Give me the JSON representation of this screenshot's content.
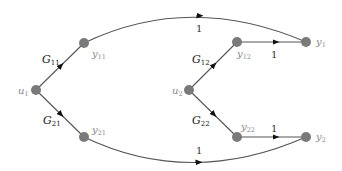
{
  "diagram": {
    "type": "signal-flow-graph",
    "nodes": [
      {
        "id": "u1",
        "label": "u",
        "sub": "1",
        "x": 36,
        "y": 90
      },
      {
        "id": "y11",
        "label": "y",
        "sub": "11",
        "x": 84,
        "y": 43
      },
      {
        "id": "y21",
        "label": "y",
        "sub": "21",
        "x": 84,
        "y": 137
      },
      {
        "id": "u2",
        "label": "u",
        "sub": "2",
        "x": 189,
        "y": 90
      },
      {
        "id": "y12",
        "label": "y",
        "sub": "12",
        "x": 237,
        "y": 42
      },
      {
        "id": "y22",
        "label": "y",
        "sub": "22",
        "x": 237,
        "y": 137
      },
      {
        "id": "y1",
        "label": "y",
        "sub": "1",
        "x": 306,
        "y": 42
      },
      {
        "id": "y2",
        "label": "y",
        "sub": "2",
        "x": 306,
        "y": 137
      }
    ],
    "edges": [
      {
        "from": "u1",
        "to": "y11",
        "gain": "G",
        "gain_sub": "11"
      },
      {
        "from": "u1",
        "to": "y21",
        "gain": "G",
        "gain_sub": "21"
      },
      {
        "from": "u2",
        "to": "y12",
        "gain": "G",
        "gain_sub": "12"
      },
      {
        "from": "u2",
        "to": "y22",
        "gain": "G",
        "gain_sub": "22"
      },
      {
        "from": "y11",
        "to": "y1",
        "gain": "1"
      },
      {
        "from": "y12",
        "to": "y1",
        "gain": "1"
      },
      {
        "from": "y21",
        "to": "y2",
        "gain": "1"
      },
      {
        "from": "y22",
        "to": "y2",
        "gain": "1"
      }
    ],
    "labels": {
      "u1": {
        "main": "u",
        "sub": "1"
      },
      "u2": {
        "main": "u",
        "sub": "2"
      },
      "y11": {
        "main": "y",
        "sub": "11"
      },
      "y21": {
        "main": "y",
        "sub": "21"
      },
      "y12": {
        "main": "y",
        "sub": "12"
      },
      "y22": {
        "main": "y",
        "sub": "22"
      },
      "y1": {
        "main": "y",
        "sub": "1"
      },
      "y2": {
        "main": "y",
        "sub": "2"
      },
      "g11": {
        "main": "G",
        "sub": "11"
      },
      "g21": {
        "main": "G",
        "sub": "21"
      },
      "g12": {
        "main": "G",
        "sub": "12"
      },
      "g22": {
        "main": "G",
        "sub": "22"
      },
      "one": "1"
    }
  }
}
